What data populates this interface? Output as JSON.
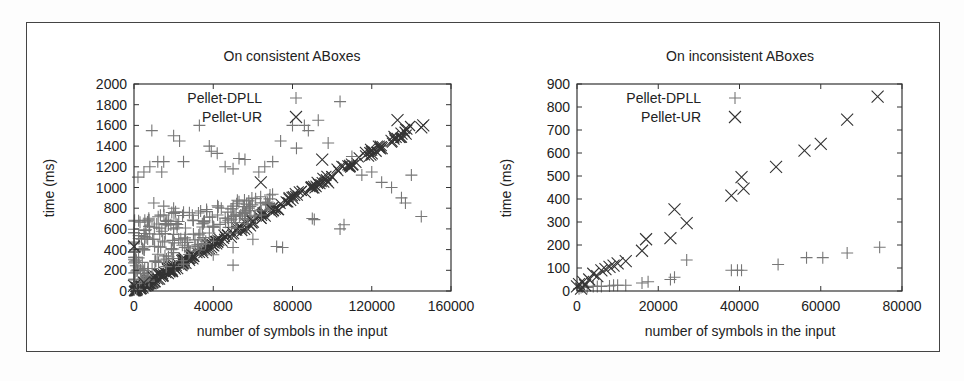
{
  "chart_data": [
    {
      "type": "scatter",
      "title": "On consistent ABoxes",
      "xlabel": "number of symbols in the input",
      "ylabel": "time (ms)",
      "xlim": [
        0,
        160000
      ],
      "ylim": [
        0,
        2000
      ],
      "xticks": [
        "0",
        "40000",
        "80000",
        "120000",
        "160000"
      ],
      "yticks": [
        "0",
        "200",
        "400",
        "600",
        "800",
        "1000",
        "1200",
        "1400",
        "1600",
        "1800",
        "2000"
      ],
      "grid": false,
      "legend_position": "top-left-inside",
      "series": [
        {
          "name": "Pellet-DPLL",
          "marker": "+",
          "description": "widely scattered points above a dense linear band; outliers up to ~1850 ms",
          "points": [
            [
              2000,
              1100
            ],
            [
              5000,
              1150
            ],
            [
              8000,
              1200
            ],
            [
              9000,
              1550
            ],
            [
              12000,
              1250
            ],
            [
              15000,
              1250
            ],
            [
              14000,
              1150
            ],
            [
              20000,
              1500
            ],
            [
              23000,
              1450
            ],
            [
              25000,
              1250
            ],
            [
              33000,
              1600
            ],
            [
              38000,
              1400
            ],
            [
              39000,
              1350
            ],
            [
              42000,
              1330
            ],
            [
              46000,
              1200
            ],
            [
              50000,
              1180
            ],
            [
              53000,
              1280
            ],
            [
              56000,
              1270
            ],
            [
              63000,
              1150
            ],
            [
              66000,
              1200
            ],
            [
              70000,
              1250
            ],
            [
              74000,
              1450
            ],
            [
              80000,
              1600
            ],
            [
              82000,
              1380
            ],
            [
              86000,
              1600
            ],
            [
              88000,
              1550
            ],
            [
              93000,
              1650
            ],
            [
              98000,
              1430
            ],
            [
              104000,
              1830
            ],
            [
              110000,
              1300
            ],
            [
              115000,
              1120
            ],
            [
              120000,
              1150
            ],
            [
              125000,
              1050
            ],
            [
              130000,
              1000
            ],
            [
              135000,
              900
            ],
            [
              137000,
              850
            ],
            [
              145000,
              720
            ],
            [
              140000,
              1120
            ],
            [
              90000,
              700
            ],
            [
              91000,
              690
            ],
            [
              104000,
              600
            ],
            [
              106000,
              640
            ],
            [
              72000,
              430
            ],
            [
              75000,
              420
            ],
            [
              60000,
              500
            ],
            [
              50000,
              250
            ],
            [
              10000,
              850
            ],
            [
              15000,
              820
            ],
            [
              20000,
              800
            ],
            [
              25000,
              760
            ],
            [
              30000,
              680
            ],
            [
              35000,
              650
            ],
            [
              40000,
              620
            ],
            [
              30000,
              550
            ],
            [
              20000,
              600
            ],
            [
              10000,
              500
            ],
            [
              5000,
              400
            ],
            [
              15000,
              300
            ],
            [
              25000,
              260
            ],
            [
              40000,
              350
            ],
            [
              50000,
              420
            ]
          ]
        },
        {
          "name": "Pellet-UR",
          "marker": "x",
          "description": "tight linear band from (0,0) to ~(145000,1600), ~11 ms per 1000 symbols",
          "points": [
            [
              0,
              430
            ],
            [
              0,
              50
            ],
            [
              5000,
              80
            ],
            [
              10000,
              130
            ],
            [
              20000,
              230
            ],
            [
              30000,
              340
            ],
            [
              40000,
              440
            ],
            [
              50000,
              560
            ],
            [
              60000,
              670
            ],
            [
              70000,
              780
            ],
            [
              80000,
              900
            ],
            [
              90000,
              1000
            ],
            [
              100000,
              1100
            ],
            [
              110000,
              1220
            ],
            [
              120000,
              1330
            ],
            [
              125000,
              1380
            ],
            [
              130000,
              1450
            ],
            [
              135000,
              1520
            ],
            [
              133000,
              1650
            ],
            [
              145000,
              1580
            ],
            [
              146000,
              1600
            ],
            [
              95000,
              1270
            ],
            [
              98000,
              1050
            ],
            [
              64000,
              1050
            ]
          ]
        }
      ]
    },
    {
      "type": "scatter",
      "title": "On inconsistent ABoxes",
      "xlabel": "number of symbols in the input",
      "ylabel": "time (ms)",
      "xlim": [
        0,
        80000
      ],
      "ylim": [
        0,
        900
      ],
      "xticks": [
        "0",
        "20000",
        "40000",
        "60000",
        "80000"
      ],
      "yticks": [
        "0",
        "100",
        "200",
        "300",
        "400",
        "500",
        "600",
        "700",
        "800",
        "900"
      ],
      "grid": false,
      "legend_position": "top-left-inside",
      "series": [
        {
          "name": "Pellet-DPLL",
          "marker": "+",
          "points": [
            [
              500,
              10
            ],
            [
              1000,
              15
            ],
            [
              1500,
              20
            ],
            [
              2500,
              15
            ],
            [
              4000,
              20
            ],
            [
              5000,
              20
            ],
            [
              6000,
              20
            ],
            [
              8000,
              22
            ],
            [
              9000,
              25
            ],
            [
              10000,
              25
            ],
            [
              12000,
              25
            ],
            [
              16000,
              35
            ],
            [
              17500,
              40
            ],
            [
              23000,
              50
            ],
            [
              24000,
              60
            ],
            [
              27000,
              135
            ],
            [
              38000,
              90
            ],
            [
              39500,
              90
            ],
            [
              40500,
              90
            ],
            [
              49500,
              115
            ],
            [
              56500,
              145
            ],
            [
              60500,
              145
            ],
            [
              66500,
              165
            ],
            [
              74500,
              190
            ]
          ]
        },
        {
          "name": "Pellet-UR",
          "marker": "x",
          "points": [
            [
              0,
              20
            ],
            [
              500,
              30
            ],
            [
              1000,
              10
            ],
            [
              1500,
              40
            ],
            [
              2000,
              25
            ],
            [
              3000,
              50
            ],
            [
              4000,
              75
            ],
            [
              5000,
              65
            ],
            [
              6000,
              90
            ],
            [
              7000,
              95
            ],
            [
              8000,
              105
            ],
            [
              9000,
              110
            ],
            [
              10000,
              120
            ],
            [
              12000,
              130
            ],
            [
              16000,
              175
            ],
            [
              17000,
              225
            ],
            [
              23000,
              230
            ],
            [
              24000,
              355
            ],
            [
              27000,
              295
            ],
            [
              38000,
              415
            ],
            [
              40500,
              495
            ],
            [
              41000,
              445
            ],
            [
              49000,
              540
            ],
            [
              56000,
              610
            ],
            [
              60000,
              640
            ],
            [
              66500,
              745
            ],
            [
              74000,
              845
            ]
          ]
        }
      ]
    }
  ]
}
